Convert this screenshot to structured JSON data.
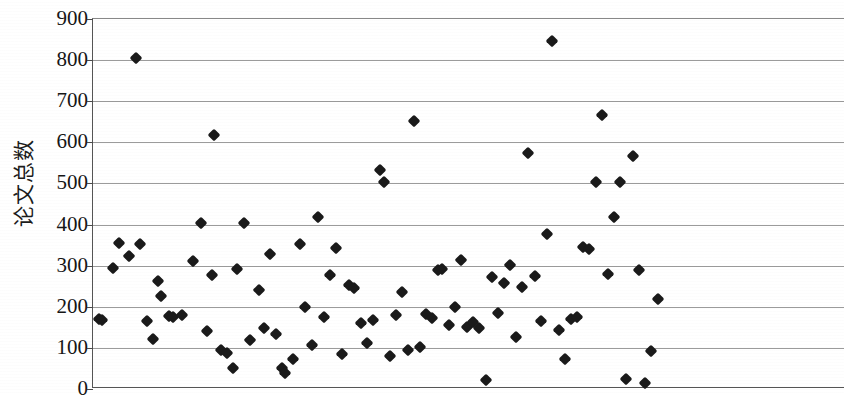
{
  "chart_data": {
    "type": "scatter",
    "title": "",
    "xlabel": "",
    "ylabel": "论文总数",
    "ylim": [
      0,
      900
    ],
    "ytick_values": [
      900,
      800,
      700,
      600,
      500,
      400,
      300,
      200,
      100,
      0
    ],
    "ytick_labels": [
      "900",
      "800",
      "700",
      "600",
      "500",
      "400",
      "300",
      "200",
      "100",
      "0"
    ],
    "ytick_step": 100,
    "xlim": [
      0,
      170
    ],
    "xticks_visible": false,
    "grid": "horizontal",
    "legend": "none",
    "marker": "diamond",
    "marker_color": "#1a1a1a",
    "marker_size_px": 9,
    "series": [
      {
        "name": "论文总数",
        "points": [
          [
            1,
            168
          ],
          [
            2,
            165
          ],
          [
            3,
            240
          ],
          [
            4,
            104
          ],
          [
            5,
            158
          ],
          [
            6,
            121
          ],
          [
            7,
            260
          ],
          [
            8,
            170
          ],
          [
            9,
            123
          ],
          [
            10,
            228
          ],
          [
            11,
            176
          ],
          [
            12,
            181
          ],
          [
            13,
            313
          ],
          [
            14,
            404
          ],
          [
            15,
            141
          ],
          [
            16,
            278
          ],
          [
            17,
            95
          ],
          [
            18,
            88
          ],
          [
            19,
            51
          ],
          [
            20,
            293
          ],
          [
            21,
            404
          ],
          [
            22,
            120
          ],
          [
            23,
            241
          ],
          [
            24,
            148
          ],
          [
            25,
            328
          ],
          [
            26,
            135
          ],
          [
            27,
            50
          ],
          [
            28,
            40
          ],
          [
            29,
            72
          ],
          [
            30,
            353
          ],
          [
            31,
            200
          ],
          [
            32,
            106
          ],
          [
            33,
            418
          ],
          [
            34,
            176
          ],
          [
            35,
            278
          ],
          [
            36,
            342
          ],
          [
            37,
            86
          ],
          [
            38,
            252
          ],
          [
            39,
            246
          ],
          [
            40,
            160
          ],
          [
            41,
            113
          ],
          [
            42,
            169
          ],
          [
            43,
            533
          ],
          [
            44,
            503
          ],
          [
            45,
            81
          ],
          [
            46,
            179
          ],
          [
            47,
            237
          ],
          [
            48,
            96
          ],
          [
            49,
            652
          ],
          [
            50,
            101
          ],
          [
            51,
            182
          ],
          [
            52,
            173
          ],
          [
            53,
            290
          ],
          [
            54,
            293
          ],
          [
            55,
            155
          ],
          [
            56,
            199
          ],
          [
            57,
            315
          ],
          [
            58,
            152
          ],
          [
            59,
            163
          ],
          [
            60,
            148
          ],
          [
            61,
            847
          ],
          [
            62,
            23
          ],
          [
            63,
            272
          ],
          [
            64,
            186
          ],
          [
            65,
            258
          ],
          [
            66,
            301
          ],
          [
            67,
            127
          ],
          [
            68,
            247
          ],
          [
            69,
            574
          ],
          [
            70,
            276
          ],
          [
            71,
            165
          ],
          [
            72,
            376
          ],
          [
            73,
            143
          ],
          [
            74,
            73
          ],
          [
            75,
            170
          ],
          [
            76,
            176
          ],
          [
            77,
            345
          ],
          [
            78,
            340
          ],
          [
            79,
            504
          ],
          [
            80,
            666
          ],
          [
            81,
            279
          ],
          [
            82,
            418
          ],
          [
            83,
            504
          ],
          [
            84,
            24
          ],
          [
            85,
            566
          ],
          [
            86,
            290
          ],
          [
            87,
            14
          ],
          [
            88,
            93
          ],
          [
            89,
            219
          ]
        ]
      }
    ],
    "point_pixel_positions": [
      [
        98,
        171
      ],
      [
        101,
        169
      ],
      [
        112,
        294
      ],
      [
        118,
        356
      ],
      [
        128,
        324
      ],
      [
        135,
        805
      ],
      [
        139,
        353
      ],
      [
        146,
        165
      ],
      [
        152,
        121
      ],
      [
        157,
        263
      ],
      [
        160,
        227
      ],
      [
        168,
        178
      ],
      [
        172,
        176
      ],
      [
        181,
        180
      ],
      [
        192,
        312
      ],
      [
        200,
        404
      ],
      [
        206,
        140
      ],
      [
        211,
        278
      ],
      [
        213,
        619
      ],
      [
        220,
        96
      ],
      [
        226,
        88
      ],
      [
        232,
        51
      ],
      [
        236,
        293
      ],
      [
        243,
        404
      ],
      [
        249,
        120
      ],
      [
        258,
        241
      ],
      [
        263,
        148
      ],
      [
        269,
        328
      ],
      [
        275,
        135
      ],
      [
        281,
        50
      ],
      [
        284,
        40
      ],
      [
        292,
        72
      ],
      [
        299,
        353
      ],
      [
        304,
        200
      ],
      [
        311,
        106
      ],
      [
        317,
        418
      ],
      [
        323,
        176
      ],
      [
        329,
        278
      ],
      [
        335,
        342
      ],
      [
        341,
        86
      ],
      [
        348,
        252
      ],
      [
        353,
        246
      ],
      [
        360,
        160
      ],
      [
        366,
        113
      ],
      [
        372,
        169
      ],
      [
        379,
        533
      ],
      [
        383,
        503
      ],
      [
        389,
        81
      ],
      [
        395,
        179
      ],
      [
        401,
        237
      ],
      [
        407,
        96
      ],
      [
        413,
        652
      ],
      [
        419,
        101
      ],
      [
        425,
        182
      ],
      [
        431,
        173
      ],
      [
        437,
        290
      ],
      [
        441,
        293
      ],
      [
        448,
        155
      ],
      [
        454,
        199
      ],
      [
        460,
        315
      ],
      [
        466,
        152
      ],
      [
        472,
        163
      ],
      [
        478,
        148
      ],
      [
        485,
        23
      ],
      [
        491,
        272
      ],
      [
        497,
        186
      ],
      [
        503,
        258
      ],
      [
        509,
        301
      ],
      [
        515,
        127
      ],
      [
        521,
        247
      ],
      [
        527,
        574
      ],
      [
        534,
        276
      ],
      [
        540,
        165
      ],
      [
        546,
        376
      ],
      [
        551,
        847
      ],
      [
        558,
        143
      ],
      [
        564,
        73
      ],
      [
        570,
        170
      ],
      [
        576,
        176
      ],
      [
        582,
        345
      ],
      [
        588,
        340
      ],
      [
        595,
        504
      ],
      [
        601,
        666
      ],
      [
        607,
        279
      ],
      [
        613,
        418
      ],
      [
        619,
        504
      ],
      [
        625,
        24
      ],
      [
        632,
        566
      ],
      [
        638,
        290
      ],
      [
        644,
        14
      ],
      [
        650,
        93
      ],
      [
        657,
        219
      ]
    ]
  },
  "axes": {
    "plot_left_px": 92,
    "plot_top_px": 18,
    "plot_width_px": 752,
    "plot_height_px": 370
  }
}
